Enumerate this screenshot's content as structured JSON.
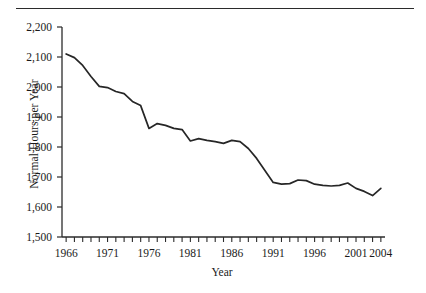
{
  "figure": {
    "rule_top": "horizontal-rule"
  },
  "chart_data": {
    "type": "line",
    "title": "",
    "xlabel": "Year",
    "ylabel": "Normal Hours per Year",
    "xlim": [
      1965.5,
      2004.5
    ],
    "ylim": [
      1500,
      2200
    ],
    "ytick_labels": [
      "2,200",
      "2,100",
      "2,000",
      "1,900",
      "1,800",
      "1,700",
      "1,600",
      "1,500"
    ],
    "ytick_values": [
      2200,
      2100,
      2000,
      1900,
      1800,
      1700,
      1600,
      1500
    ],
    "xtick_labels": [
      "1966",
      "1971",
      "1976",
      "1981",
      "1986",
      "1991",
      "1996",
      "2001",
      "2004"
    ],
    "xtick_values": [
      1966,
      1971,
      1976,
      1981,
      1986,
      1991,
      1996,
      2001,
      2004
    ],
    "minor_xticks_every": 1,
    "grid": false,
    "legend": "none",
    "line_color": "#262626",
    "line_width": 1.7,
    "x": [
      1966,
      1967,
      1968,
      1969,
      1970,
      1971,
      1972,
      1973,
      1974,
      1975,
      1976,
      1977,
      1978,
      1979,
      1980,
      1981,
      1982,
      1983,
      1984,
      1985,
      1986,
      1987,
      1988,
      1989,
      1990,
      1991,
      1992,
      1993,
      1994,
      1995,
      1996,
      1997,
      1998,
      1999,
      2000,
      2001,
      2002,
      2003,
      2004
    ],
    "values": [
      2110,
      2098,
      2072,
      2035,
      2002,
      1998,
      1985,
      1978,
      1952,
      1938,
      1862,
      1878,
      1872,
      1862,
      1858,
      1820,
      1828,
      1822,
      1818,
      1812,
      1822,
      1818,
      1795,
      1762,
      1722,
      1682,
      1676,
      1678,
      1690,
      1688,
      1676,
      1672,
      1670,
      1672,
      1680,
      1662,
      1652,
      1638,
      1662
    ],
    "series_name": "Normal hours per year"
  }
}
